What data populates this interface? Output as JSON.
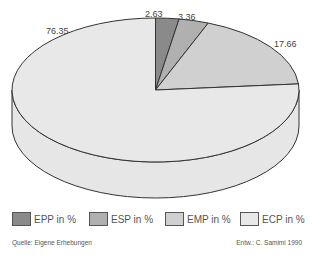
{
  "chart_data": {
    "type": "pie",
    "style": "3d-tilted",
    "title": "",
    "start_angle": "12 o'clock, clockwise",
    "categories": [
      "EPP in %",
      "ESP in %",
      "EMP in %",
      "ECP in %"
    ],
    "values": [
      2.63,
      3.36,
      17.66,
      76.35
    ],
    "value_labels": [
      "2.63",
      "3.36",
      "17.66",
      "76.35"
    ],
    "colors": [
      "#8a8a8a",
      "#b0b0b0",
      "#d0d0d0",
      "#e8e8e8"
    ],
    "legend_position": "bottom",
    "xlabel": "",
    "ylabel": ""
  },
  "legend": {
    "items": [
      {
        "label": "EPP in %",
        "color": "#8a8a8a"
      },
      {
        "label": "ESP in %",
        "color": "#b0b0b0"
      },
      {
        "label": "EMP in %",
        "color": "#d0d0d0"
      },
      {
        "label": "ECP in %",
        "color": "#e8e8e8"
      }
    ]
  },
  "footer": {
    "source": "Quelle: Eigene Erhebungen",
    "author": "Entw.: C. Samimi 1990"
  }
}
